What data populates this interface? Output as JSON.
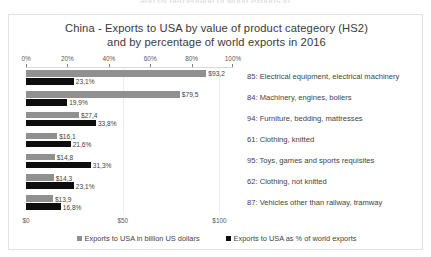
{
  "chart_data": {
    "type": "bar",
    "title": "China - Exports to USA by value of product categeory (HS2) and by percentage of world exports in 2016",
    "title_line1": "China - Exports to USA by value of product categeory (HS2)",
    "title_line2": "and by percentage of world exports in 2016",
    "orientation": "horizontal",
    "grid": true,
    "legend_position": "bottom",
    "categories": [
      "85: Electrical equipment, electrical machinery",
      "84: Machinery, engines, boilers",
      "94: Furniture, bedding, mattresses",
      "61: Clothing, knitted",
      "95: Toys, games and sports requisites",
      "62: Clothing, not knitted",
      "87: Vehicles other than railway, tramway"
    ],
    "series": [
      {
        "name": "Exports to USA in billion US dollars",
        "color": "#909090",
        "axis": "bottom",
        "values": [
          93.2,
          79.5,
          27.4,
          16.1,
          14.8,
          14.3,
          13.9
        ],
        "labels": [
          "$93,2",
          "$79,5",
          "$27,4",
          "$16,1",
          "$14,8",
          "$14,3",
          "$13,9"
        ]
      },
      {
        "name": "Exports to USA as % of world exports",
        "color": "#0d0d0d",
        "axis": "top",
        "values": [
          23.1,
          19.9,
          33.8,
          21.6,
          31.3,
          23.1,
          16.8
        ],
        "labels": [
          "23,1%",
          "19,9%",
          "33,8%",
          "21,6%",
          "31,3%",
          "23,1%",
          "16,8%"
        ]
      }
    ],
    "top_axis": {
      "label": "percentage of world exports",
      "ticks": [
        0,
        20,
        40,
        60,
        80,
        100
      ],
      "tick_labels": [
        "0%",
        "20%",
        "40%",
        "60%",
        "80%",
        "100%"
      ],
      "range": [
        0,
        100
      ]
    },
    "bottom_axis": {
      "label": "billion US dollars",
      "ticks": [
        0,
        50,
        100
      ],
      "tick_labels": [
        "$0",
        "$50",
        "$100"
      ],
      "range": [
        0,
        107
      ]
    }
  },
  "legend": {
    "items": [
      {
        "label": "Exports to USA in billion US dollars",
        "color": "#909090"
      },
      {
        "label": "Exports to USA as % of world exports",
        "color": "#0d0d0d"
      }
    ]
  },
  "artifacts": {
    "top_cutoff_text": "and by percentage of world exports in"
  }
}
